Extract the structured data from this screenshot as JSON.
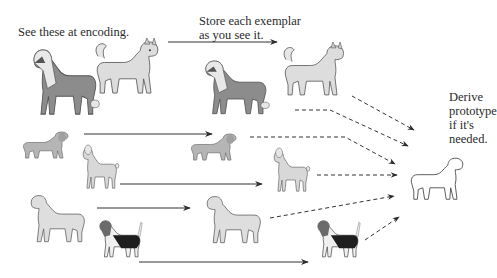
{
  "labels": {
    "encoding": "See these at encoding.",
    "store_line1": "Store each exemplar",
    "store_line2": "as you see it.",
    "derive_line1": "Derive",
    "derive_line2": "prototype",
    "derive_line3": "if it's",
    "derive_line4": "needed."
  },
  "exemplars": [
    {
      "breed": "collie",
      "color": "#8a8a8a"
    },
    {
      "breed": "husky",
      "color": "#d9d9d9"
    },
    {
      "breed": "dachshund",
      "color": "#b3b3b3"
    },
    {
      "breed": "poodle",
      "color": "#d6d6d6"
    },
    {
      "breed": "bulldog",
      "color": "#dcdcdc"
    },
    {
      "breed": "basset-hound",
      "color": "#2a2a2a"
    }
  ],
  "prototype": {
    "breed": "prototype-dog",
    "style": "outline"
  },
  "colors": {
    "arrow": "#333333",
    "dog_outline": "#666666",
    "background": "#ffffff"
  }
}
